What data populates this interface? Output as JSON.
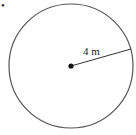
{
  "diagram": {
    "shape": "circle",
    "radius_label": "4 m",
    "marker": "•",
    "colors": {
      "stroke": "#555555",
      "dot": "#111111",
      "text": "#222222"
    }
  }
}
